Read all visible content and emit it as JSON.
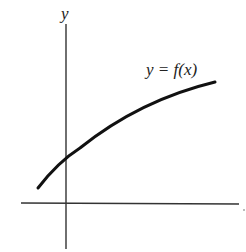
{
  "figure": {
    "type": "function-graph",
    "axes": {
      "y_label": "y",
      "x_label": "",
      "axis_color": "#333333"
    },
    "curve": {
      "label": "y = f(x)",
      "color": "#111111",
      "description": "increasing, concave-down curve crossing the positive y-axis"
    }
  }
}
